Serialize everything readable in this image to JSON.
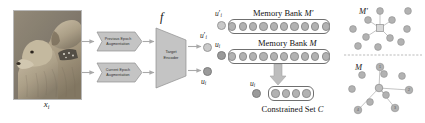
{
  "figure": {
    "input": {
      "caption_base": "x",
      "caption_sub": "i",
      "alt": "photograph of two golden retriever dogs"
    },
    "augmentations": [
      {
        "id": "previous-epoch",
        "line1": "Previous Epoch",
        "line2": "Augmentation"
      },
      {
        "id": "current-epoch",
        "line1": "Current Epoch",
        "line2": "Augmentation"
      }
    ],
    "encoder": {
      "symbol": "f",
      "line1": "Target",
      "line2": "Encoder"
    },
    "encoder_outputs": [
      {
        "id": "u-prime",
        "base": "u",
        "prime": "′",
        "sub": "i",
        "shade": "light"
      },
      {
        "id": "u",
        "base": "u",
        "prime": "",
        "sub": "i",
        "shade": "dark"
      }
    ],
    "memory_banks": [
      {
        "id": "memory-bank-prime",
        "title_text": "Memory Bank ",
        "title_symbol": "M′",
        "slot_count": 10,
        "side_label_base": "u",
        "side_label_prime": "′",
        "side_label_sub": "i"
      },
      {
        "id": "memory-bank",
        "title_text": "Memory Bank ",
        "title_symbol": "M",
        "slot_count": 10,
        "side_label_base": "u",
        "side_label_prime": "",
        "side_label_sub": "i"
      }
    ],
    "constrained_set": {
      "id": "constrained-set",
      "caption_text": "Constrained Set ",
      "caption_symbol": "C",
      "slot_count": 4,
      "side_label_base": "u",
      "side_label_sub": "i"
    },
    "embedding_panels": [
      {
        "id": "panel-m-prime",
        "label": "M′",
        "description": "scattered embedding points with a highlighted anchor connected to neighbours",
        "node_labels": []
      },
      {
        "id": "panel-m",
        "label": "M",
        "description": "embedding points with central anchor connected by edges to numbered neighbours",
        "node_labels": [
          "1",
          "2",
          "3",
          "4"
        ]
      }
    ],
    "colors": {
      "node_fill": "#b2b2b2",
      "node_stroke": "#909090",
      "box_stroke": "#6f6f6f",
      "shape_fill": "#c4c4c4",
      "arrow": "#a9a9a9",
      "text": "#141414"
    }
  }
}
